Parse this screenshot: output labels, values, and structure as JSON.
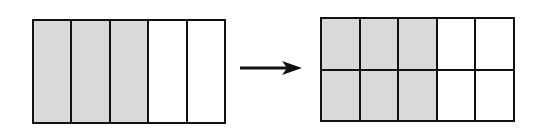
{
  "diagram": {
    "left_model": {
      "columns": 5,
      "rows": 1,
      "shaded_columns": 3,
      "fraction": "3/5"
    },
    "arrow": {
      "direction": "right",
      "icon": "right-arrow-icon"
    },
    "right_model": {
      "columns": 5,
      "rows": 2,
      "shaded_columns": 3,
      "fraction": "6/10"
    },
    "colors": {
      "line": "#111111",
      "shaded": "#d9d9d9",
      "unshaded": "#ffffff"
    }
  }
}
